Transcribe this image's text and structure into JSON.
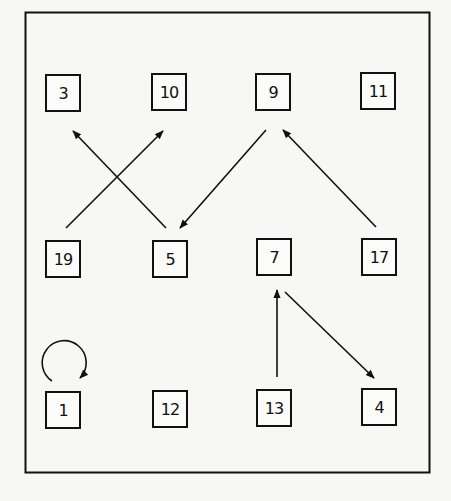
{
  "diagram": {
    "type": "directed-graph",
    "frame": {
      "x": 25,
      "y": 12,
      "width": 405,
      "height": 461
    },
    "nodes": [
      {
        "id": "3",
        "label": "3",
        "x": 45,
        "y": 74
      },
      {
        "id": "10",
        "label": "10",
        "x": 151,
        "y": 73
      },
      {
        "id": "9",
        "label": "9",
        "x": 255,
        "y": 73
      },
      {
        "id": "11",
        "label": "11",
        "x": 360,
        "y": 72
      },
      {
        "id": "19",
        "label": "19",
        "x": 45,
        "y": 240
      },
      {
        "id": "5",
        "label": "5",
        "x": 152,
        "y": 240
      },
      {
        "id": "7",
        "label": "7",
        "x": 256,
        "y": 238
      },
      {
        "id": "17",
        "label": "17",
        "x": 361,
        "y": 238
      },
      {
        "id": "1",
        "label": "1",
        "x": 45,
        "y": 391
      },
      {
        "id": "12",
        "label": "12",
        "x": 152,
        "y": 390
      },
      {
        "id": "13",
        "label": "13",
        "x": 256,
        "y": 389
      },
      {
        "id": "4",
        "label": "4",
        "x": 361,
        "y": 388
      }
    ],
    "edges": [
      {
        "from": "19",
        "to": "10"
      },
      {
        "from": "5",
        "to": "3"
      },
      {
        "from": "9",
        "to": "5"
      },
      {
        "from": "17",
        "to": "9"
      },
      {
        "from": "13",
        "to": "7"
      },
      {
        "from": "7",
        "to": "4"
      },
      {
        "from": "1",
        "to": "1",
        "self_loop": true
      }
    ]
  }
}
